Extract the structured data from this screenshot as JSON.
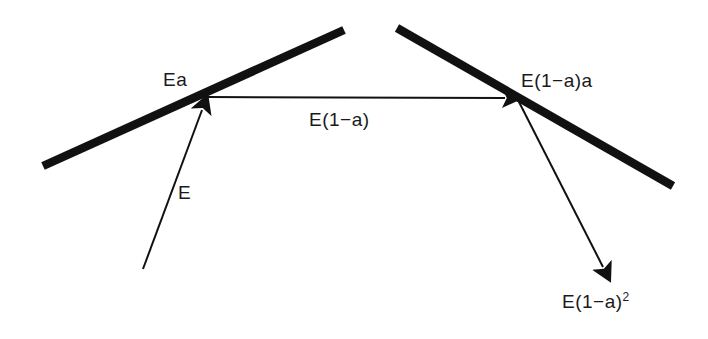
{
  "figure": {
    "background_color": "#ffffff",
    "stroke_color": "#111111",
    "labels": {
      "incident": "E",
      "reflected_first": "Ea",
      "transmitted_first": "E(1−a)",
      "reflected_second": "E(1−a)a",
      "transmitted_second_base": "E(1−a)",
      "transmitted_second_exponent": "2"
    },
    "surfaces": [
      {
        "name": "left-surface",
        "x1": 43,
        "y1": 166,
        "x2": 344,
        "y2": 30
      },
      {
        "name": "right-surface",
        "x1": 397,
        "y1": 28,
        "x2": 673,
        "y2": 186
      }
    ],
    "rays": [
      {
        "name": "incident-ray",
        "x1": 143,
        "y1": 269,
        "x2": 206,
        "y2": 99
      },
      {
        "name": "horizontal-ray",
        "x1": 207,
        "y1": 97,
        "x2": 517,
        "y2": 98
      },
      {
        "name": "outgoing-ray",
        "x1": 518,
        "y1": 100,
        "x2": 609,
        "y2": 279
      }
    ]
  }
}
